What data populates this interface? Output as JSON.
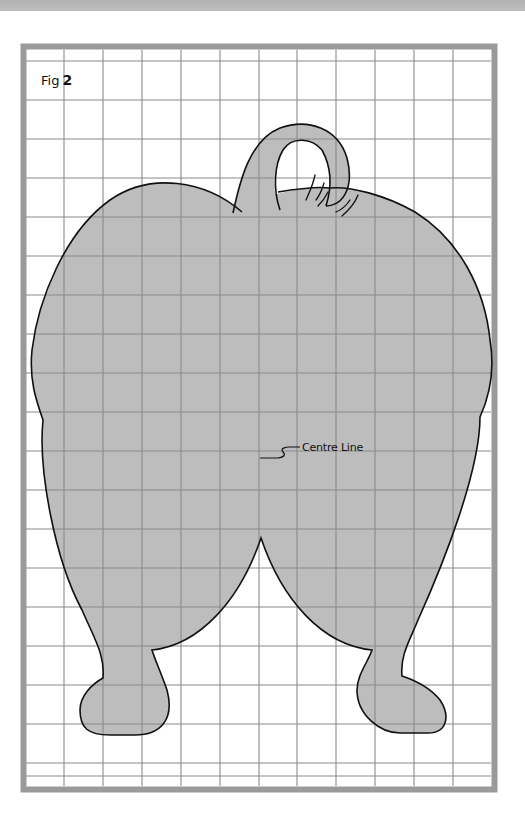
{
  "figure": {
    "label_prefix": "Fig",
    "label_number": "2",
    "annotation": "Centre Line",
    "colors": {
      "background": "#ffffff",
      "top_band": "#b7b7b7",
      "frame": "#999999",
      "grid_line": "#8c8c8c",
      "shape_fill": "#bcbcbc",
      "outline": "#111111"
    },
    "grid": {
      "cell_size_px": 39,
      "columns": 12,
      "rows": 19
    }
  }
}
